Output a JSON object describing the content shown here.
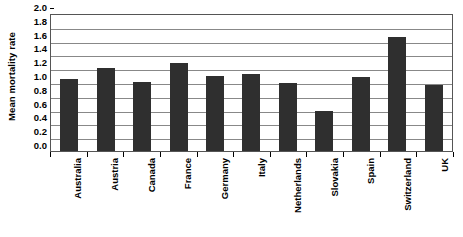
{
  "chart_data": {
    "type": "bar",
    "title": "",
    "xlabel": "",
    "ylabel": "Mean mortality rate",
    "categories": [
      "Australia",
      "Austria",
      "Canada",
      "France",
      "Germany",
      "Italy",
      "Netherlands",
      "Slovakia",
      "Spain",
      "Switzerland",
      "UK"
    ],
    "values": [
      1.05,
      1.21,
      1.0,
      1.28,
      1.09,
      1.11,
      0.98,
      0.58,
      1.07,
      1.65,
      0.96
    ],
    "ylim": [
      0.0,
      2.0
    ],
    "ytick_step": 0.2,
    "ytick_labels": [
      "0.0",
      "0.2",
      "0.4",
      "0.6",
      "0.8",
      "1.0",
      "1.2",
      "1.4",
      "1.6",
      "1.8",
      "2.0"
    ],
    "ytick_values": [
      0.0,
      0.2,
      0.4,
      0.6,
      0.8,
      1.0,
      1.2,
      1.4,
      1.6,
      1.8,
      2.0
    ],
    "grid": true,
    "grid_axis": "y",
    "legend": false,
    "legend_position": "none",
    "bar_color": "#2f2f2f",
    "plot_background": "#ffffff",
    "gridline_color": "#888888",
    "axis_color": "#555555",
    "text_color": "#000000"
  }
}
